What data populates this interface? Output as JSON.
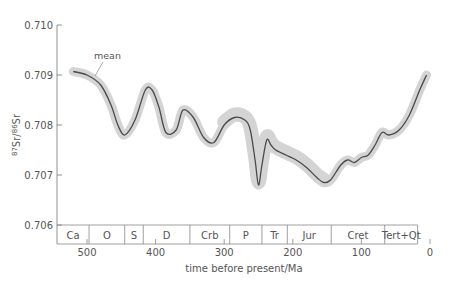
{
  "chart_data": {
    "type": "line",
    "title": "",
    "xlabel": "time before present/Ma",
    "ylabel": "87Sr/86Sr",
    "ylabel_parts": {
      "sup1": "87",
      "main1": "Sr/",
      "sup2": "86",
      "main2": "Sr"
    },
    "xlim": [
      520,
      0
    ],
    "ylim": [
      0.706,
      0.71
    ],
    "x_ticks": [
      "500",
      "400",
      "300",
      "200",
      "100",
      "0"
    ],
    "y_ticks": [
      "0.710",
      "0.709",
      "0.708",
      "0.707",
      "0.706"
    ],
    "grid": false,
    "annotation": "mean",
    "series": [
      {
        "name": "mean",
        "x": [
          520,
          500,
          480,
          465,
          455,
          445,
          430,
          415,
          405,
          395,
          385,
          370,
          360,
          345,
          330,
          315,
          300,
          285,
          270,
          262,
          255,
          250,
          245,
          238,
          232,
          225,
          210,
          195,
          180,
          165,
          155,
          145,
          130,
          120,
          110,
          100,
          90,
          80,
          70,
          60,
          45,
          30,
          15,
          5
        ],
        "y": [
          0.70907,
          0.709,
          0.7088,
          0.7084,
          0.708,
          0.7078,
          0.7081,
          0.7087,
          0.7087,
          0.70835,
          0.70785,
          0.7079,
          0.7083,
          0.70815,
          0.70775,
          0.70765,
          0.708,
          0.70815,
          0.7081,
          0.7079,
          0.7073,
          0.7068,
          0.7072,
          0.7077,
          0.7076,
          0.7075,
          0.7074,
          0.7073,
          0.70715,
          0.70695,
          0.70685,
          0.7069,
          0.7072,
          0.7073,
          0.70725,
          0.70735,
          0.7074,
          0.7076,
          0.70785,
          0.7078,
          0.7079,
          0.7082,
          0.7087,
          0.709
        ]
      }
    ],
    "uncertainty_band": "grey envelope around mean",
    "periods": [
      {
        "label": "Ca",
        "from": 520,
        "to": 497
      },
      {
        "label": "O",
        "from": 497,
        "to": 445
      },
      {
        "label": "S",
        "from": 445,
        "to": 418
      },
      {
        "label": "D",
        "from": 418,
        "to": 350
      },
      {
        "label": "Crb",
        "from": 350,
        "to": 292
      },
      {
        "label": "P",
        "from": 292,
        "to": 245
      },
      {
        "label": "Tr",
        "from": 245,
        "to": 208
      },
      {
        "label": "Jur",
        "from": 208,
        "to": 144
      },
      {
        "label": "Cret",
        "from": 144,
        "to": 66
      },
      {
        "label": "Tert+Qt",
        "from": 66,
        "to": 18
      }
    ]
  }
}
